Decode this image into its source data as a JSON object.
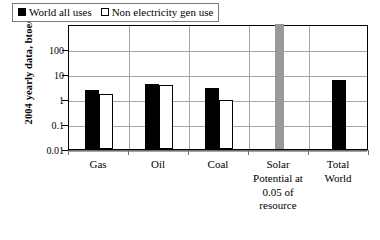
{
  "clipped_header_text": "·· ·· ·· ··· ··· ···· ·· ···· ···· ··· ·· ···· ·· ···· ····· ··",
  "chart_data": {
    "type": "bar",
    "title": "",
    "xlabel": "",
    "ylabel": "2004 yearly data, btoe/yr",
    "yscale": "log",
    "ylim": [
      0.01,
      1000
    ],
    "ytick_labels": [
      "100",
      "10",
      "1",
      "0.1",
      "0.01"
    ],
    "ytick_values": [
      100,
      10,
      1,
      0.1,
      0.01
    ],
    "grid": true,
    "legend_position": "top-left",
    "categories": [
      "Gas",
      "Oil",
      "Coal",
      "Solar Potential at 0.05 of resource",
      "Total World"
    ],
    "series": [
      {
        "name": "World all uses",
        "color": "#000000",
        "style": "filled",
        "values": [
          2.3,
          4.0,
          2.7,
          null,
          6.0
        ]
      },
      {
        "name": "Non electricity gen use",
        "color": "#ffffff",
        "style": "hollow",
        "values": [
          1.6,
          3.6,
          0.9,
          null,
          null
        ]
      },
      {
        "name": "Solar potential",
        "color": "#999999",
        "style": "solid-gray",
        "values": [
          null,
          null,
          null,
          1000,
          null
        ]
      }
    ],
    "annotations": [
      "Solar potential bar is off-scale (exceeds plot top)"
    ]
  },
  "legend": {
    "items": [
      {
        "label": "World all uses",
        "swatch": "filled"
      },
      {
        "label": "Non electricity gen use",
        "swatch": "hollow"
      }
    ]
  },
  "xlabels": [
    {
      "lines": [
        "Gas"
      ]
    },
    {
      "lines": [
        "Oil"
      ]
    },
    {
      "lines": [
        "Coal"
      ]
    },
    {
      "lines": [
        "Solar",
        "Potential at",
        "0.05 of",
        "resource"
      ]
    },
    {
      "lines": [
        "Total",
        "World"
      ]
    }
  ]
}
